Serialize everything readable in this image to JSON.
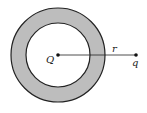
{
  "diagram": {
    "labels": {
      "center_charge": "Q",
      "distance": "r",
      "test_charge": "q"
    },
    "colors": {
      "shell_fill": "#bdbdbd",
      "stroke": "#222222",
      "background": "#ffffff"
    }
  }
}
